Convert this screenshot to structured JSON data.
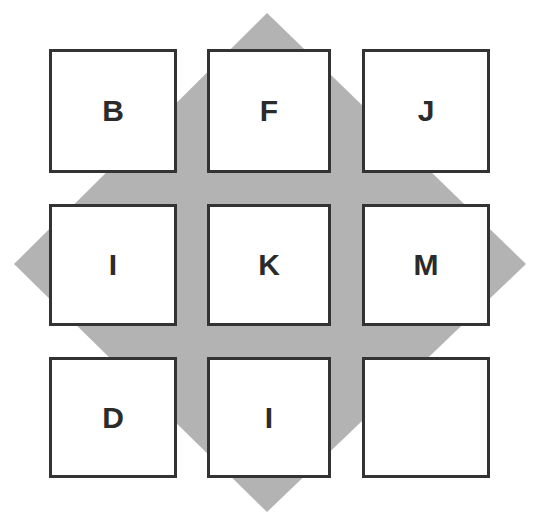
{
  "colors": {
    "background": "#ffffff",
    "diamond_fill": "#b3b3b3",
    "box_fill": "#ffffff",
    "box_border": "#333333",
    "letter": "#2b2b2b"
  },
  "diamond": {
    "points": "267,13 526,264 267,512 14,264"
  },
  "grid": {
    "rows": 3,
    "cols": 3,
    "cells": [
      {
        "row": 0,
        "col": 0,
        "letter": "B"
      },
      {
        "row": 0,
        "col": 1,
        "letter": "F"
      },
      {
        "row": 0,
        "col": 2,
        "letter": "J"
      },
      {
        "row": 1,
        "col": 0,
        "letter": "I"
      },
      {
        "row": 1,
        "col": 1,
        "letter": "K"
      },
      {
        "row": 1,
        "col": 2,
        "letter": "M"
      },
      {
        "row": 2,
        "col": 0,
        "letter": "D"
      },
      {
        "row": 2,
        "col": 1,
        "letter": "I"
      },
      {
        "row": 2,
        "col": 2,
        "letter": ""
      }
    ]
  }
}
